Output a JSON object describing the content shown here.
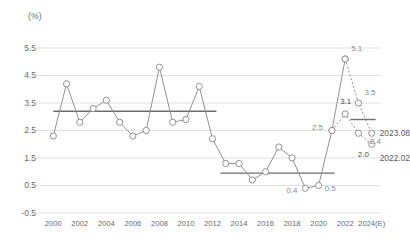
{
  "chart_data": {
    "type": "line",
    "title": "",
    "subtitle": "",
    "xlabel": "",
    "ylabel": "(%)",
    "unit_label": "(%)",
    "ylim": [
      -0.5,
      5.9
    ],
    "xlim": [
      1999.3,
      2024.7
    ],
    "grid": true,
    "legend_position": "inline-right",
    "yticks": [
      "5.5",
      "4.5",
      "3.5",
      "2.5",
      "1.5",
      "0.5",
      "-0.5"
    ],
    "ytick_values": [
      5.5,
      4.5,
      3.5,
      2.5,
      1.5,
      0.5,
      -0.5
    ],
    "xticks": [
      "2000",
      "2002",
      "2004",
      "2006",
      "2008",
      "2010",
      "2012",
      "2014",
      "2016",
      "2018",
      "2020",
      "2022",
      "2024(E)"
    ],
    "xtick_values": [
      2000,
      2002,
      2004,
      2006,
      2008,
      2010,
      2012,
      2014,
      2016,
      2018,
      2020,
      2022,
      2024
    ],
    "x": [
      2000,
      2001,
      2002,
      2003,
      2004,
      2005,
      2006,
      2007,
      2008,
      2009,
      2010,
      2011,
      2012,
      2013,
      2014,
      2015,
      2016,
      2017,
      2018,
      2019,
      2020,
      2021,
      2022
    ],
    "values": [
      2.3,
      4.2,
      2.8,
      3.3,
      3.6,
      2.8,
      2.3,
      2.5,
      4.8,
      2.8,
      2.9,
      4.1,
      2.2,
      1.3,
      1.3,
      0.7,
      1.0,
      1.9,
      1.5,
      0.4,
      0.5,
      2.5,
      5.1
    ],
    "series": [
      {
        "name": "actual",
        "style": "solid",
        "x": [
          2000,
          2001,
          2002,
          2003,
          2004,
          2005,
          2006,
          2007,
          2008,
          2009,
          2010,
          2011,
          2012,
          2013,
          2014,
          2015,
          2016,
          2017,
          2018,
          2019,
          2020,
          2021,
          2022
        ],
        "values": [
          2.3,
          4.2,
          2.8,
          3.3,
          3.6,
          2.8,
          2.3,
          2.5,
          4.8,
          2.8,
          2.9,
          4.1,
          2.2,
          1.3,
          1.3,
          0.7,
          1.0,
          1.9,
          1.5,
          0.4,
          0.5,
          2.5,
          5.1
        ]
      },
      {
        "name": "2023.08",
        "style": "dotted",
        "x": [
          2022,
          2023,
          2024
        ],
        "values": [
          5.1,
          3.5,
          2.4
        ]
      },
      {
        "name": "2022.02",
        "style": "dotted",
        "x": [
          2021,
          2022,
          2023,
          2024
        ],
        "values": [
          2.5,
          3.1,
          2.4,
          2.0
        ]
      }
    ],
    "average_lines": [
      {
        "name": "avg-2000-2012",
        "value": 3.2,
        "x_start": 2000,
        "x_end": 2012.3
      },
      {
        "name": "avg-2013-2021",
        "value": 0.95,
        "x_start": 2012.6,
        "x_end": 2021.2
      },
      {
        "name": "avg-2022-2024",
        "value": 2.9,
        "x_start": 2022.4,
        "x_end": 2024.3
      }
    ],
    "point_labels": [
      {
        "text": "5.1",
        "x": 2022,
        "value": 5.1,
        "dx": 6,
        "dy": -10
      },
      {
        "text": "3.5",
        "x": 2023,
        "value": 3.5,
        "dx": 6,
        "dy": -10
      },
      {
        "text": "3.1",
        "x": 2022,
        "value": 3.1,
        "dx": -5,
        "dy": -12
      },
      {
        "text": "2.5",
        "x": 2021,
        "value": 2.5,
        "dx": -20,
        "dy": -3
      },
      {
        "text": "2.4",
        "x": 2024,
        "value": 2.4,
        "dx": -2,
        "dy": 9
      },
      {
        "text": "2.0",
        "x": 2024,
        "value": 2.0,
        "dx": -14,
        "dy": 11
      },
      {
        "text": "0.4",
        "x": 2019,
        "value": 0.4,
        "dx": -19,
        "dy": 3
      },
      {
        "text": "0.5",
        "x": 2020,
        "value": 0.5,
        "dx": 6,
        "dy": 3
      }
    ],
    "legend_entries": [
      {
        "label": "2023.08",
        "x": 2024,
        "value": 2.4
      },
      {
        "label": "2022.02",
        "x": 2024,
        "value": 2.0
      }
    ],
    "colors": {
      "line": "#8c8c8c",
      "marker_fill": "#ffffff",
      "marker_stroke": "#8c8c8c",
      "grid": "#d9d9d9",
      "average_line": "#6e6e6e",
      "tick_text": "#6b6b6b",
      "label_text": "#8a8a8a",
      "legend_text": "#5a5a5a",
      "background": "#ffffff"
    }
  }
}
